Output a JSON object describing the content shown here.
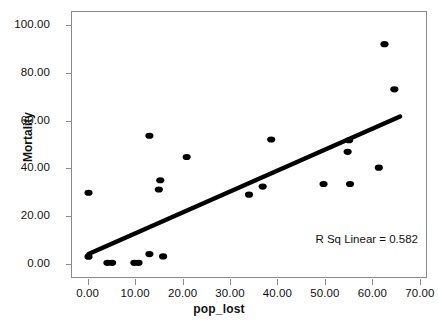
{
  "chart_data": {
    "type": "scatter",
    "title": "",
    "xlabel": "pop_lost",
    "ylabel": "Mortality",
    "xlim": [
      -3.5,
      71.5
    ],
    "ylim": [
      -6.0,
      106.0
    ],
    "grid": false,
    "legend": null,
    "xticks": [
      "0.00",
      "10.00",
      "20.00",
      "30.00",
      "40.00",
      "50.00",
      "60.00",
      "70.00"
    ],
    "xtick_values": [
      0,
      10,
      20,
      30,
      40,
      50,
      60,
      70
    ],
    "yticks": [
      "0.00",
      "20.00",
      "40.00",
      "60.00",
      "80.00",
      "100.00"
    ],
    "ytick_values": [
      0,
      20,
      40,
      60,
      80,
      100
    ],
    "marker": "filled-circle",
    "marker_color": "#000000",
    "points": [
      {
        "x": 0.0,
        "y": 29.6
      },
      {
        "x": 0.0,
        "y": 2.6
      },
      {
        "x": 4.0,
        "y": 0.0
      },
      {
        "x": 5.0,
        "y": 0.0
      },
      {
        "x": 9.7,
        "y": 0.0
      },
      {
        "x": 10.6,
        "y": 0.0
      },
      {
        "x": 12.9,
        "y": 53.7
      },
      {
        "x": 12.9,
        "y": 3.7
      },
      {
        "x": 14.9,
        "y": 31.0
      },
      {
        "x": 15.2,
        "y": 34.9
      },
      {
        "x": 15.8,
        "y": 2.7
      },
      {
        "x": 20.8,
        "y": 44.7
      },
      {
        "x": 34.0,
        "y": 28.8
      },
      {
        "x": 36.9,
        "y": 32.2
      },
      {
        "x": 38.7,
        "y": 52.1
      },
      {
        "x": 49.8,
        "y": 33.3
      },
      {
        "x": 54.9,
        "y": 46.9
      },
      {
        "x": 55.2,
        "y": 51.8
      },
      {
        "x": 55.4,
        "y": 33.3
      },
      {
        "x": 61.5,
        "y": 40.2
      },
      {
        "x": 62.7,
        "y": 92.4
      },
      {
        "x": 64.8,
        "y": 73.3
      }
    ],
    "fit_line": {
      "type": "linear",
      "x_start": 0.0,
      "y_start": 3.7,
      "x_end": 66.0,
      "y_end": 61.8,
      "color": "#000000",
      "width": 4.5
    },
    "annotation": "R Sq Linear = 0.582"
  }
}
